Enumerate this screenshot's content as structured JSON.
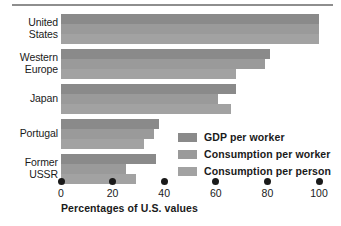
{
  "chart_data": {
    "type": "bar",
    "orientation": "horizontal",
    "title": "",
    "xlabel": "Percentages of U.S. values",
    "ylabel": "",
    "xlim": [
      0,
      100
    ],
    "xticks": [
      0,
      20,
      40,
      60,
      80,
      100
    ],
    "xtick_labels": [
      "0",
      "20",
      "40",
      "60",
      "80",
      "100"
    ],
    "grid": false,
    "legend_position": "inside-right-lower",
    "categories": [
      "United States",
      "Western Europe",
      "Japan",
      "Portugal",
      "Former USSR"
    ],
    "category_lines": [
      [
        "United",
        "States"
      ],
      [
        "Western",
        "Europe"
      ],
      [
        "Japan"
      ],
      [
        "Portugal"
      ],
      [
        "Former",
        "USSR"
      ]
    ],
    "series": [
      {
        "name": "GDP per worker",
        "color": "#8a8a8a",
        "values": [
          100,
          81,
          68,
          38,
          37
        ]
      },
      {
        "name": "Consumption per worker",
        "color": "#9a9a9a",
        "values": [
          100,
          79,
          61,
          36,
          25
        ]
      },
      {
        "name": "Consumption per person",
        "color": "#a2a2a2",
        "values": [
          100,
          68,
          66,
          32,
          29
        ]
      }
    ]
  },
  "colors": {
    "rule": "#8e8e8e",
    "text": "#1a1a1a",
    "background": "#ffffff"
  }
}
